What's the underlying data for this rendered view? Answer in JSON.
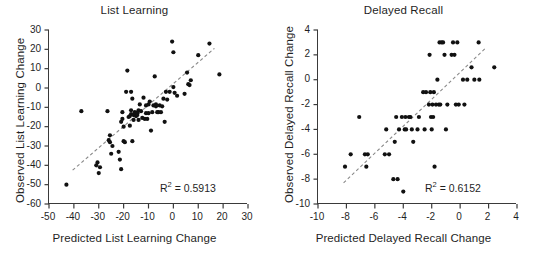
{
  "figure": {
    "background_color": "#ffffff",
    "marker_color": "#111111",
    "axis_color": "#3a3a3a",
    "trendline_color": "#8a8a8a"
  },
  "chart_data": [
    {
      "type": "scatter",
      "panel": "left",
      "title": "List Learning",
      "xlabel": "Predicted List Learning Change",
      "ylabel": "Observed List Learning Change",
      "xlim": [
        -50,
        30
      ],
      "ylim": [
        -60,
        30
      ],
      "xticks": [
        -50,
        -40,
        -30,
        -20,
        -10,
        0,
        10,
        20,
        30
      ],
      "xtick_labels": [
        "-50",
        "-40",
        "-30",
        "-20",
        "-10",
        "0",
        "10",
        "20",
        "30"
      ],
      "yticks": [
        -60,
        -50,
        -40,
        -30,
        -20,
        -10,
        0,
        10,
        20,
        30
      ],
      "ytick_labels": [
        "-60",
        "-50",
        "-40",
        "-30",
        "-20",
        "-10",
        "0",
        "10",
        "20",
        "30"
      ],
      "grid": false,
      "legend": false,
      "annotation": "R2 = 0.5913",
      "r_squared": 0.5913,
      "trendline": {
        "style": "dashed",
        "x": [
          -40.5,
          16.5
        ],
        "y": [
          -42.5,
          20.5
        ]
      },
      "x": [
        -43.0,
        -37.0,
        -31.0,
        -30.5,
        -30.0,
        -29.5,
        -26.5,
        -26.0,
        -25.5,
        -25.5,
        -25.0,
        -24.5,
        -22.0,
        -21.5,
        -21.0,
        -21.0,
        -20.5,
        -20.5,
        -20.0,
        -20.0,
        -19.5,
        -19.0,
        -18.5,
        -18.0,
        -17.5,
        -17.5,
        -17.0,
        -17.0,
        -17.0,
        -16.5,
        -16.5,
        -16.0,
        -16.0,
        -15.5,
        -15.5,
        -15.0,
        -15.0,
        -14.5,
        -14.5,
        -14.0,
        -14.0,
        -13.5,
        -13.0,
        -12.5,
        -12.0,
        -11.5,
        -11.0,
        -11.0,
        -10.5,
        -10.0,
        -10.0,
        -9.5,
        -9.0,
        -8.5,
        -8.0,
        -7.5,
        -7.0,
        -7.0,
        -6.5,
        -6.0,
        -5.5,
        -5.0,
        -4.5,
        -4.0,
        -3.5,
        -3.0,
        -2.5,
        -1.5,
        -0.5,
        0.0,
        0.0,
        0.5,
        1.5,
        4.5,
        5.5,
        6.0,
        6.5,
        7.0,
        10.0,
        14.5,
        18.5
      ],
      "y": [
        -50.0,
        -12.0,
        -40.0,
        -38.5,
        -44.0,
        -41.0,
        -12.0,
        -27.0,
        -28.0,
        -24.5,
        -34.0,
        -30.0,
        -33.0,
        -37.0,
        -42.0,
        -17.5,
        -16.0,
        -12.5,
        -20.0,
        -27.5,
        -28.0,
        -2.0,
        9.0,
        -15.0,
        -14.5,
        -19.5,
        -13.5,
        -11.5,
        -2.0,
        -27.5,
        -5.5,
        -14.0,
        -16.5,
        -13.0,
        -12.5,
        -14.5,
        -13.0,
        -13.0,
        -14.0,
        -11.5,
        -16.5,
        -8.5,
        -12.0,
        -15.5,
        -5.0,
        -16.0,
        -9.0,
        -13.0,
        -16.0,
        -13.0,
        -8.5,
        -7.0,
        -22.0,
        -12.5,
        -9.0,
        6.0,
        -9.5,
        -8.5,
        -12.5,
        -12.5,
        -9.0,
        -12.5,
        -9.5,
        -5.5,
        -17.5,
        -2.0,
        -6.0,
        -2.0,
        24.0,
        18.5,
        0.5,
        -2.5,
        -4.0,
        -3.0,
        8.0,
        2.0,
        1.5,
        4.0,
        17.0,
        23.0,
        7.0
      ]
    },
    {
      "type": "scatter",
      "panel": "right",
      "title": "Delayed Recall",
      "xlabel": "Predicted Delayed Recall Change",
      "ylabel": "Observed Delayed Recall Change",
      "xlim": [
        -10,
        4
      ],
      "ylim": [
        -10,
        4
      ],
      "xticks": [
        -10,
        -8,
        -6,
        -4,
        -2,
        0,
        2,
        4
      ],
      "xtick_labels": [
        "-10",
        "-8",
        "-6",
        "-4",
        "-2",
        "0",
        "2",
        "4"
      ],
      "yticks": [
        -10,
        -8,
        -6,
        -4,
        -2,
        0,
        2,
        4
      ],
      "ytick_labels": [
        "-10",
        "-8",
        "-6",
        "-4",
        "-2",
        "0",
        "2",
        "4"
      ],
      "grid": false,
      "legend": false,
      "annotation": "R2 = 0.6152",
      "r_squared": 0.6152,
      "trendline": {
        "style": "dashed",
        "x": [
          -8.2,
          1.75
        ],
        "y": [
          -8.3,
          2.5
        ]
      },
      "x": [
        -8.1,
        -7.7,
        -7.1,
        -6.7,
        -6.6,
        -6.5,
        -5.3,
        -5.2,
        -5.0,
        -4.7,
        -4.6,
        -4.5,
        -4.4,
        -4.3,
        -4.1,
        -4.0,
        -3.9,
        -3.85,
        -3.8,
        -3.6,
        -3.5,
        -3.4,
        -3.3,
        -3.0,
        -2.9,
        -2.6,
        -2.5,
        -2.4,
        -2.2,
        -2.15,
        -2.1,
        -2.05,
        -2.0,
        -1.95,
        -1.9,
        -1.85,
        -1.8,
        -1.7,
        -1.6,
        -1.5,
        -1.45,
        -1.4,
        -1.3,
        -1.2,
        -1.1,
        -1.0,
        -0.9,
        -0.6,
        -0.5,
        -0.4,
        -0.3,
        -0.2,
        -0.1,
        0.2,
        0.3,
        0.5,
        0.8,
        1.0,
        1.3,
        1.35,
        2.4
      ],
      "y": [
        -7.0,
        -6.0,
        -3.0,
        -6.0,
        -7.0,
        -6.0,
        -6.0,
        -4.0,
        -6.0,
        -8.0,
        -5.0,
        -3.0,
        -8.0,
        -4.0,
        -3.0,
        -9.0,
        -4.0,
        -3.0,
        -4.0,
        -3.0,
        -3.0,
        -4.0,
        -5.0,
        -4.0,
        -3.0,
        -1.0,
        -4.0,
        -1.0,
        -2.0,
        2.0,
        -1.0,
        -3.0,
        -4.0,
        -2.0,
        -3.0,
        -1.0,
        -7.0,
        -2.0,
        0.0,
        -2.0,
        3.0,
        -2.0,
        3.0,
        3.0,
        2.0,
        -4.0,
        -2.0,
        2.0,
        3.0,
        2.0,
        -2.0,
        3.0,
        -2.0,
        0.0,
        -2.0,
        0.0,
        1.0,
        0.0,
        3.0,
        0.0,
        1.0
      ]
    }
  ]
}
